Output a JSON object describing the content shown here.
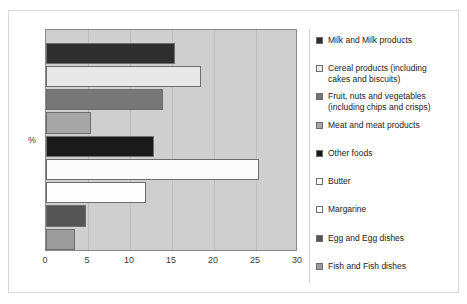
{
  "chart_data": {
    "type": "bar",
    "orientation": "horizontal",
    "title": "",
    "xlabel": "",
    "ylabel": "%",
    "xlim": [
      0,
      30
    ],
    "xticks": [
      "0",
      "5",
      "10",
      "15",
      "20",
      "25",
      "30"
    ],
    "grid": true,
    "legend_position": "right",
    "categories": [
      "Milk and Milk products",
      "Cereal products (including\ncakes and biscuits)",
      "Fruit, nuts and vegetables\n(including chips and crisps)",
      "Meat and meat products",
      "Other foods",
      "Butter",
      "Margarine",
      "Egg and Egg dishes",
      "Fish and Fish dishes"
    ],
    "values": [
      15.3,
      18.5,
      13.9,
      5.3,
      12.9,
      25.4,
      11.9,
      4.8,
      3.4
    ],
    "colors": [
      "#2e2e2e",
      "#e8e8e8",
      "#777777",
      "#a6a6a6",
      "#1a1a1a",
      "#fbfbfb",
      "#fdfdfd",
      "#555555",
      "#9c9c9c"
    ]
  },
  "legend": {
    "items": [
      {
        "label": "Milk and Milk products",
        "color": "#2e2e2e"
      },
      {
        "label": "Cereal products (including\ncakes and biscuits)",
        "color": "#e8e8e8"
      },
      {
        "label": "Fruit, nuts and vegetables\n(including chips and crisps)",
        "color": "#777777"
      },
      {
        "label": "Meat and meat products",
        "color": "#a6a6a6"
      },
      {
        "label": "Other foods",
        "color": "#1a1a1a"
      },
      {
        "label": "Butter",
        "color": "#fbfbfb"
      },
      {
        "label": "Margarine",
        "color": "#fdfdfd"
      },
      {
        "label": "Egg and Egg dishes",
        "color": "#555555"
      },
      {
        "label": "Fish and Fish dishes",
        "color": "#9c9c9c"
      }
    ]
  }
}
